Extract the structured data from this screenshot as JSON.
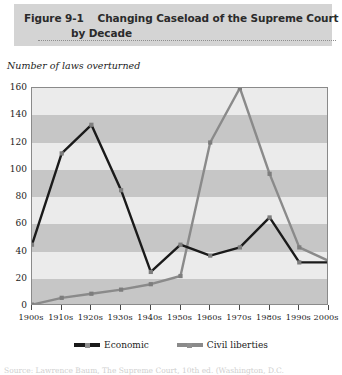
{
  "figure": {
    "label": "Figure 9-1",
    "title_line1": "Changing Caseload of the Supreme Court",
    "title_line2": "by Decade"
  },
  "axis_title": "Number of laws overturned",
  "legend": {
    "economic": "Economic",
    "civil_liberties": "Civil liberties"
  },
  "colors": {
    "economic": "#1a1a1a",
    "civil_liberties": "#8a8a8a",
    "banner": "#d4d4d4",
    "band_light": "#ebebeb",
    "band_dark": "#c6c6c6",
    "axis": "#8a8a8a"
  },
  "source": "Source: Lawrence Baum, The Supreme Court, 10th ed. (Washington, D.C.",
  "chart_data": {
    "type": "line",
    "title": "Changing Caseload of the Supreme Court by Decade",
    "xlabel": "",
    "ylabel": "Number of laws overturned",
    "categories": [
      "1900s",
      "1910s",
      "1920s",
      "1930s",
      "1940s",
      "1950s",
      "1960s",
      "1970s",
      "1980s",
      "1990s",
      "2000s"
    ],
    "ylim": [
      0,
      160
    ],
    "yticks": [
      0,
      20,
      40,
      60,
      80,
      100,
      120,
      140,
      160
    ],
    "grid": "horizontal-bands",
    "legend_position": "bottom-center",
    "series": [
      {
        "name": "Economic",
        "color": "#1a1a1a",
        "values": [
          45,
          112,
          133,
          85,
          25,
          45,
          37,
          43,
          65,
          32,
          32
        ]
      },
      {
        "name": "Civil liberties",
        "color": "#8a8a8a",
        "values": [
          1,
          6,
          9,
          12,
          16,
          22,
          120,
          160,
          97,
          43,
          33
        ]
      }
    ]
  }
}
